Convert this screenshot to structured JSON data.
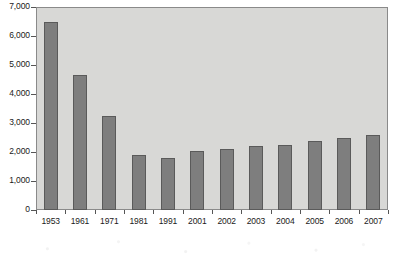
{
  "chart_data": {
    "type": "bar",
    "title": "",
    "subtitle": "",
    "xlabel": "",
    "ylabel": "",
    "categories": [
      "1953",
      "1961",
      "1971",
      "1981",
      "1991",
      "2001",
      "2002",
      "2003",
      "2004",
      "2005",
      "2006",
      "2007"
    ],
    "values": [
      6500,
      4650,
      3230,
      1890,
      1810,
      2030,
      2110,
      2200,
      2230,
      2390,
      2470,
      2580
    ],
    "ylim": [
      0,
      7000
    ],
    "y_ticks": [
      0,
      1000,
      2000,
      3000,
      4000,
      5000,
      6000,
      7000
    ],
    "y_tick_labels": [
      "0",
      "1,000",
      "2,000",
      "3,000",
      "4,000",
      "5,000",
      "6,000",
      "7,000"
    ],
    "grid": false,
    "legend": false,
    "legend_position": "none",
    "annotations": [],
    "colors": {
      "bar_fill": "#7e7e7e",
      "bar_border": "#5a5a5a",
      "plot_background": "#d8d8d6",
      "plot_border": "#8a8a8a",
      "axis": "#555555",
      "text": "#1a1a1a",
      "page_background": "#ffffff"
    }
  }
}
